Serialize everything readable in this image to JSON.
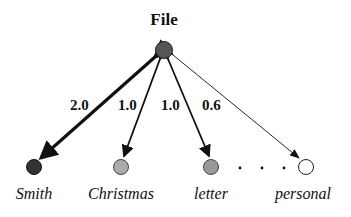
{
  "diagram": {
    "root": {
      "label": "File",
      "fill": "#555555"
    },
    "children": [
      {
        "label": "Smith",
        "weight": "2.0",
        "fill": "#333333"
      },
      {
        "label": "Christmas",
        "weight": "1.0",
        "fill": "#aaaaaa"
      },
      {
        "label": "letter",
        "weight": "1.0",
        "fill": "#999999"
      },
      {
        "label": "personal",
        "weight": "0.6",
        "fill": "#ffffff"
      }
    ],
    "ellipsis": "..."
  }
}
